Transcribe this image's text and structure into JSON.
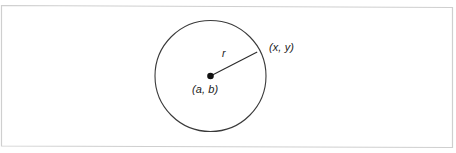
{
  "figure": {
    "background_color": "#ffffff",
    "border_color": "#c9c9c9",
    "stroke_color": "#333333",
    "labels": {
      "radius": "r",
      "center_point": "(a, b)",
      "circle_point": "(x, y)"
    },
    "geometry": {
      "circle_center_x": 210.5,
      "circle_center_y": 76,
      "circle_radius": 55.5,
      "radius_line_end_x": 257,
      "radius_line_end_y": 52,
      "center_dot_radius": 3.2
    }
  }
}
